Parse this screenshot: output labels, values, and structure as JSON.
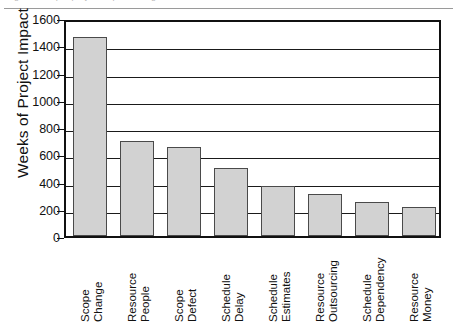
{
  "figure": {
    "top_ghost_text": "Figure 1. Top 8 project impact categories",
    "y_axis_title": "Weeks of Project Impact"
  },
  "chart_data": {
    "type": "bar",
    "title": "",
    "subtitle": "",
    "xlabel": "",
    "ylabel": "Weeks of Project Impact",
    "ylim": [
      0,
      1600
    ],
    "ytick_step": 200,
    "yticks": [
      0,
      200,
      400,
      600,
      800,
      1000,
      1200,
      1400,
      1600
    ],
    "ytick_labels": [
      "0",
      "200",
      "400",
      "600",
      "800",
      "1000",
      "1200",
      "1400",
      "1600"
    ],
    "grid": true,
    "grid_axis": "y",
    "legend": false,
    "legend_position": "none",
    "bar_fill_color": "#d2d2d2",
    "bar_edge_color": "#4a4a4a",
    "axis_color": "#111111",
    "background_color": "#ffffff",
    "categories": [
      "Scope Change",
      "Resource People",
      "Scope Defect",
      "Schedule Delay",
      "Schedule Estimates",
      "Resource Outsourcing",
      "Schedule Dependency",
      "Resource Money"
    ],
    "category_lines": [
      [
        "Scope",
        "Change"
      ],
      [
        "Resource",
        "People"
      ],
      [
        "Scope",
        "Defect"
      ],
      [
        "Schedule",
        "Delay"
      ],
      [
        "Schedule",
        "Estimates"
      ],
      [
        "Resource",
        "Outsourcing"
      ],
      [
        "Schedule",
        "Dependency"
      ],
      [
        "Resource",
        "Money"
      ]
    ],
    "values": [
      1460,
      700,
      650,
      500,
      370,
      310,
      250,
      215
    ]
  }
}
